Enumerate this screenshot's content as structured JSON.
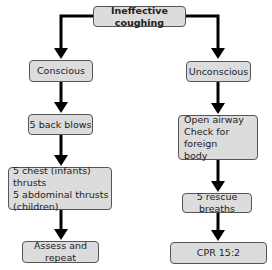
{
  "title": "Ineffective coughing",
  "branches": {
    "conscious": {
      "label": "Conscious",
      "steps": [
        "5 back blows",
        "5 chest (infants) thrusts\n5 abdominal thrusts\n(children)",
        "Assess and repeat"
      ]
    },
    "unconscious": {
      "label": "Unconscious",
      "steps": [
        "Open airway\nCheck for foreign\nbody",
        "5 rescue breaths",
        "CPR 15:2"
      ]
    }
  },
  "colors": {
    "box_fill": "#dcdcdc",
    "box_border": "#555555",
    "arrow": "#000000"
  }
}
